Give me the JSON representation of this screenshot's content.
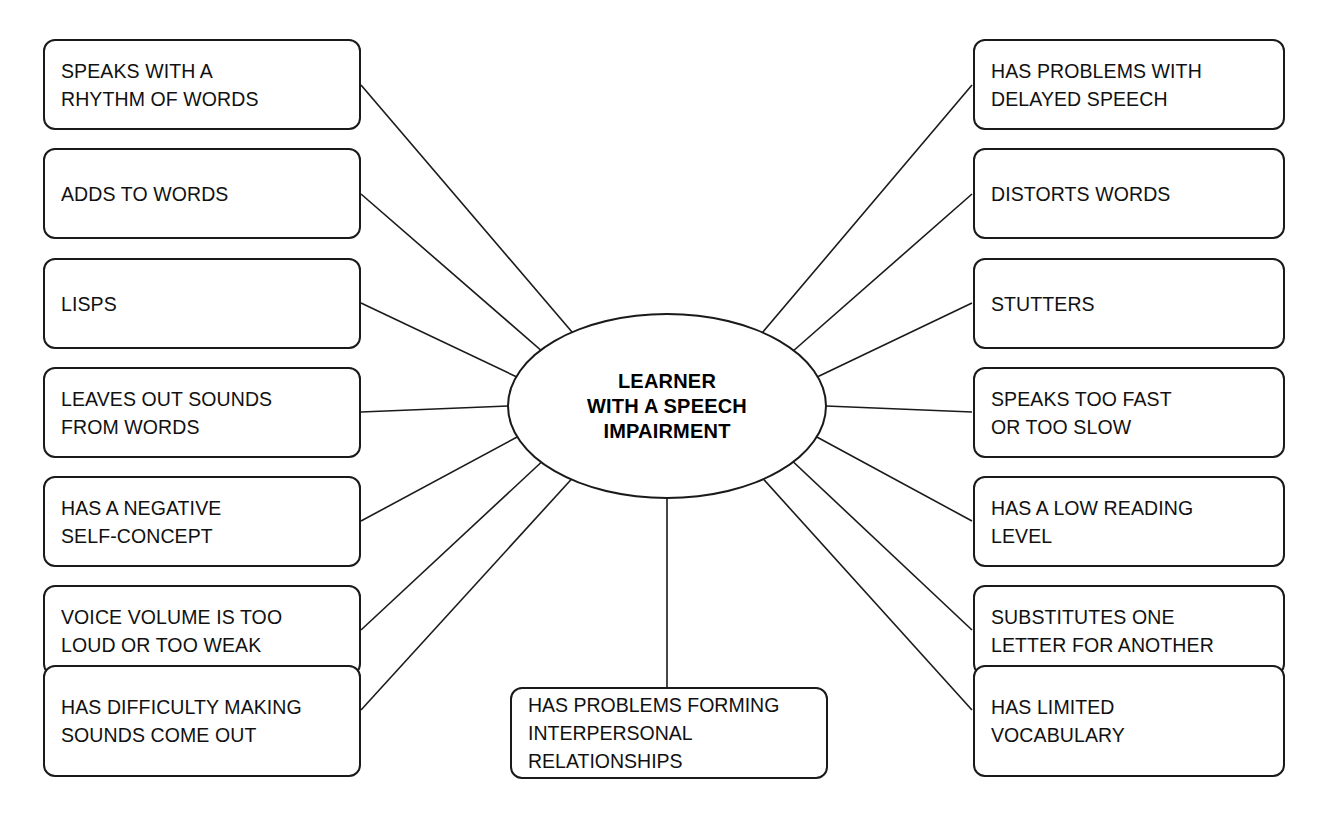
{
  "diagram": {
    "type": "mind-map",
    "background_color": "#ffffff",
    "line_color": "#1a1a1a",
    "text_color": "#111111",
    "center": {
      "label": "LEARNER\nWITH A SPEECH\nIMPAIRMENT",
      "shape": "ellipse"
    },
    "left_nodes": [
      {
        "label": "SPEAKS WITH A\nRHYTHM OF WORDS"
      },
      {
        "label": "ADDS TO WORDS"
      },
      {
        "label": "LISPS"
      },
      {
        "label": "LEAVES OUT SOUNDS\nFROM WORDS"
      },
      {
        "label": "HAS A NEGATIVE\nSELF-CONCEPT"
      },
      {
        "label": "VOICE VOLUME IS TOO\nLOUD OR TOO WEAK"
      },
      {
        "label": "HAS DIFFICULTY MAKING\nSOUNDS COME OUT"
      }
    ],
    "right_nodes": [
      {
        "label": "HAS PROBLEMS WITH\nDELAYED SPEECH"
      },
      {
        "label": "DISTORTS WORDS"
      },
      {
        "label": "STUTTERS"
      },
      {
        "label": "SPEAKS TOO FAST\nOR TOO SLOW"
      },
      {
        "label": "HAS A LOW READING\nLEVEL"
      },
      {
        "label": "SUBSTITUTES ONE\nLETTER FOR ANOTHER"
      },
      {
        "label": "HAS LIMITED\nVOCABULARY"
      }
    ],
    "bottom_node": {
      "label": "HAS PROBLEMS FORMING\nINTERPERSONAL\nRELATIONSHIPS"
    }
  },
  "layout": {
    "left_tops": [
      39,
      148,
      258,
      367,
      476,
      585,
      665
    ],
    "right_tops": [
      39,
      148,
      258,
      367,
      476,
      585,
      665
    ],
    "node_height": 91,
    "tall_node_height": 92
  }
}
